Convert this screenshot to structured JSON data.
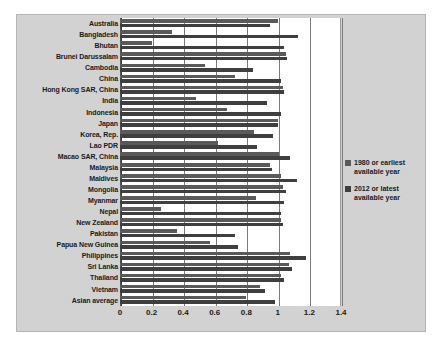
{
  "chart_data": {
    "type": "bar",
    "orientation": "horizontal",
    "title": "",
    "xlabel": "",
    "ylabel": "",
    "xlim": [
      0,
      1.4
    ],
    "xticks": [
      "0",
      "0.2",
      "0.4",
      "0.6",
      "0.8",
      "1",
      "1.2",
      "1.4"
    ],
    "xtick_values": [
      0,
      0.2,
      0.4,
      0.6,
      0.8,
      1.0,
      1.2,
      1.4
    ],
    "grid": true,
    "legend_position": "right",
    "categories": [
      "Australia",
      "Bangladesh",
      "Bhutan",
      "Brunei Darussalam",
      "Cambodia",
      "China",
      "Hong Kong SAR, China",
      "India",
      "Indonesia",
      "Japan",
      "Korea, Rep.",
      "Lao PDR",
      "Macao SAR, China",
      "Malaysia",
      "Maldives",
      "Mongolia",
      "Myanmar",
      "Nepal",
      "New Zealand",
      "Pakistan",
      "Papua New Guinea",
      "Philippines",
      "Sri Lanka",
      "Thailand",
      "Vietnam",
      "Asian average"
    ],
    "series": [
      {
        "name": "1980 or earliest available year",
        "color": "#5a5a5a",
        "values": [
          1.0,
          0.33,
          0.2,
          1.05,
          0.54,
          0.73,
          1.03,
          0.48,
          0.68,
          1.0,
          0.85,
          0.62,
          1.01,
          0.95,
          1.02,
          1.03,
          0.86,
          0.26,
          1.02,
          0.36,
          0.57,
          1.08,
          1.07,
          1.02,
          0.89,
          0.8
        ]
      },
      {
        "name": "2012 or latest available year",
        "color": "#3f3f3f",
        "values": [
          0.95,
          1.13,
          1.04,
          1.06,
          0.84,
          1.02,
          1.04,
          0.93,
          1.02,
          1.0,
          0.97,
          0.87,
          1.08,
          0.96,
          1.12,
          1.05,
          1.04,
          1.02,
          1.03,
          0.73,
          0.75,
          1.18,
          1.09,
          1.04,
          0.92,
          0.98
        ]
      }
    ]
  },
  "legend": {
    "items": [
      {
        "label": "1980 or earliest\navailable year",
        "color": "#5a5a5a"
      },
      {
        "label": "2012 or latest\navailable year",
        "color": "#3f3f3f"
      }
    ]
  },
  "colors": {
    "chart_background": "#d2d2d2",
    "plot_background": "#ffffff",
    "gridline": "#7a7a7a",
    "axis": "#3a3a3a",
    "text": "#1a1a1a"
  }
}
